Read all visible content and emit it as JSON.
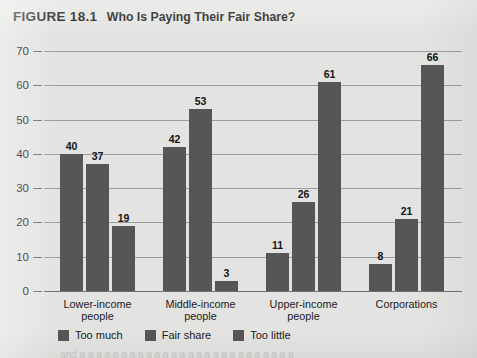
{
  "figure": {
    "number": "FIGURE 18.1",
    "title": "Who Is Paying Their Fair Share?"
  },
  "chart_data": {
    "type": "bar",
    "title": "Who Is Paying Their Fair Share?",
    "xlabel": "",
    "ylabel": "",
    "ylim": [
      0,
      70
    ],
    "yticks": [
      0,
      10,
      20,
      30,
      40,
      50,
      60,
      70
    ],
    "grid": true,
    "legend_position": "bottom-left",
    "categories": [
      "Lower-income\npeople",
      "Middle-income\npeople",
      "Upper-income\npeople",
      "Corporations"
    ],
    "series": [
      {
        "name": "Too much",
        "color": "#565656",
        "values": [
          40,
          42,
          11,
          8
        ]
      },
      {
        "name": "Fair share",
        "color": "#565656",
        "values": [
          37,
          53,
          26,
          21
        ]
      },
      {
        "name": "Too little",
        "color": "#565656",
        "values": [
          19,
          3,
          61,
          66
        ]
      }
    ]
  },
  "page_bleed": "and a a a a a a a a a a a a a a a a a a a a a a a a a a"
}
